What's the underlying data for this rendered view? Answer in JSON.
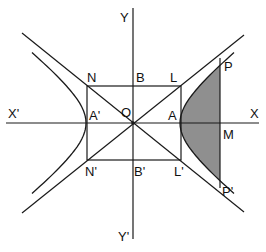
{
  "diagram": {
    "colors": {
      "line": "#1a1a1a",
      "shade": "#8f8f8f",
      "background": "#ffffff"
    },
    "labels": {
      "Y": "Y",
      "Y_prime": "Y'",
      "X": "X",
      "X_prime": "X'",
      "O": "O",
      "N": "N",
      "B": "B",
      "L": "L",
      "A": "A",
      "A_prime": "A'",
      "N_prime": "N'",
      "B_prime": "B'",
      "L_prime": "L'",
      "P": "P",
      "M": "M",
      "P_prime": "P'"
    }
  }
}
